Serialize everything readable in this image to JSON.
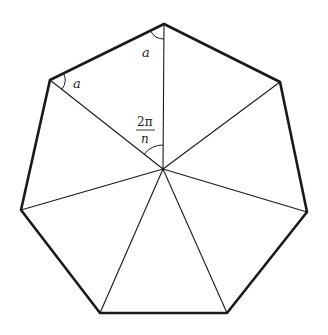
{
  "diagram": {
    "title": "",
    "shape": "regular heptagon subdivided into triangles from center",
    "colors": {
      "stroke": "#1a1a1a",
      "background": "#ffffff"
    },
    "vertices": [
      {
        "name": "top",
        "x": 164,
        "y": 24
      },
      {
        "name": "upper-right",
        "x": 280,
        "y": 82
      },
      {
        "name": "right",
        "x": 307,
        "y": 212
      },
      {
        "name": "bottom-right",
        "x": 227,
        "y": 313
      },
      {
        "name": "bottom-left",
        "x": 100,
        "y": 313
      },
      {
        "name": "left",
        "x": 21,
        "y": 210
      },
      {
        "name": "upper-left",
        "x": 50,
        "y": 80
      }
    ],
    "center": {
      "x": 163,
      "y": 169
    },
    "labels": {
      "angle_top": "a",
      "angle_left": "a",
      "central_angle_numerator": "2π",
      "central_angle_denominator": "n"
    }
  }
}
